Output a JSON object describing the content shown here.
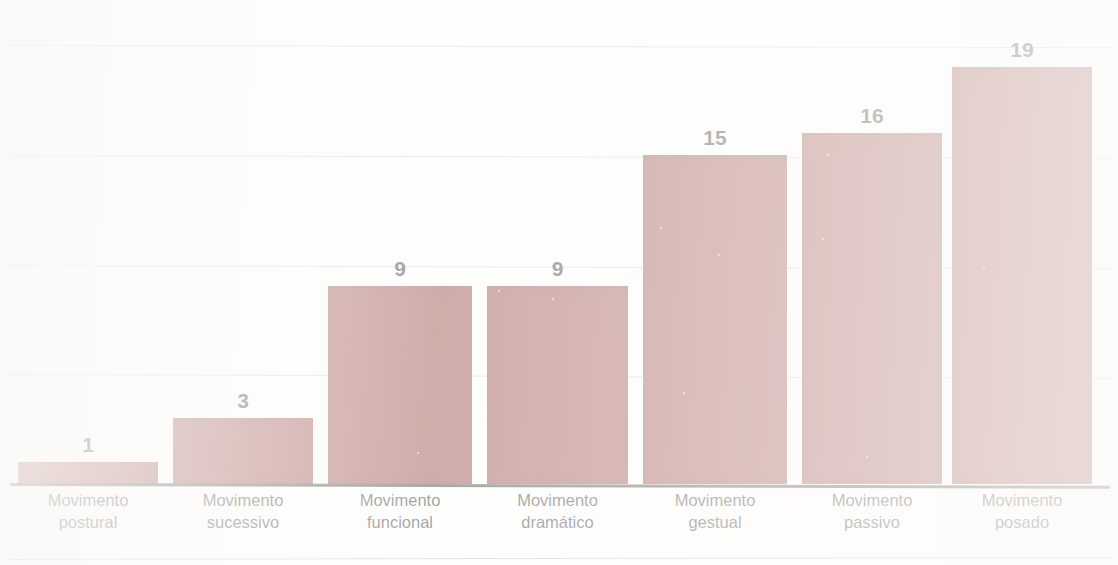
{
  "chart_data": {
    "type": "bar",
    "title": "",
    "xlabel": "",
    "ylabel": "",
    "grid": true,
    "legend": "none",
    "ylim": [
      0,
      22
    ],
    "gridline_values": [
      5,
      10,
      15,
      20
    ],
    "bar_color": "#8b3029",
    "label_color": "#141210",
    "gridline_color": "#c9c9c9",
    "axis_color": "#2b2724",
    "categories": [
      "Movimento postural",
      "Movimento sucessivo",
      "Movimento funcional",
      "Movimento dramático",
      "Movimento gestual",
      "Movimento passivo",
      "Movimento posado"
    ],
    "category_lines": [
      {
        "line1": "Movimento",
        "line2": "postural"
      },
      {
        "line1": "Movimento",
        "line2": "sucessivo"
      },
      {
        "line1": "Movimento",
        "line2": "funcional"
      },
      {
        "line1": "Movimento",
        "line2": "dramático"
      },
      {
        "line1": "Movimento",
        "line2": "gestual"
      },
      {
        "line1": "Movimento",
        "line2": "passivo"
      },
      {
        "line1": "Movimento",
        "line2": "posado"
      }
    ],
    "values": [
      1,
      3,
      9,
      9,
      15,
      16,
      19
    ],
    "value_labels": [
      "1",
      "3",
      "9",
      "9",
      "15",
      "16",
      "19"
    ]
  },
  "bars": [
    {
      "label": "Movimento postural",
      "value": 1,
      "value_label": "1",
      "left": 18,
      "width": 140
    },
    {
      "label": "Movimento sucessivo",
      "value": 3,
      "value_label": "3",
      "left": 173,
      "width": 140
    },
    {
      "label": "Movimento funcional",
      "value": 9,
      "value_label": "9",
      "left": 328,
      "width": 144
    },
    {
      "label": "Movimento dramático",
      "value": 9,
      "value_label": "9",
      "left": 487,
      "width": 141
    },
    {
      "label": "Movimento gestual",
      "value": 15,
      "value_label": "15",
      "left": 643,
      "width": 144
    },
    {
      "label": "Movimento passivo",
      "value": 16,
      "value_label": "16",
      "left": 802,
      "width": 140
    },
    {
      "label": "Movimento posado",
      "value": 19,
      "value_label": "19",
      "left": 952,
      "width": 140
    }
  ]
}
